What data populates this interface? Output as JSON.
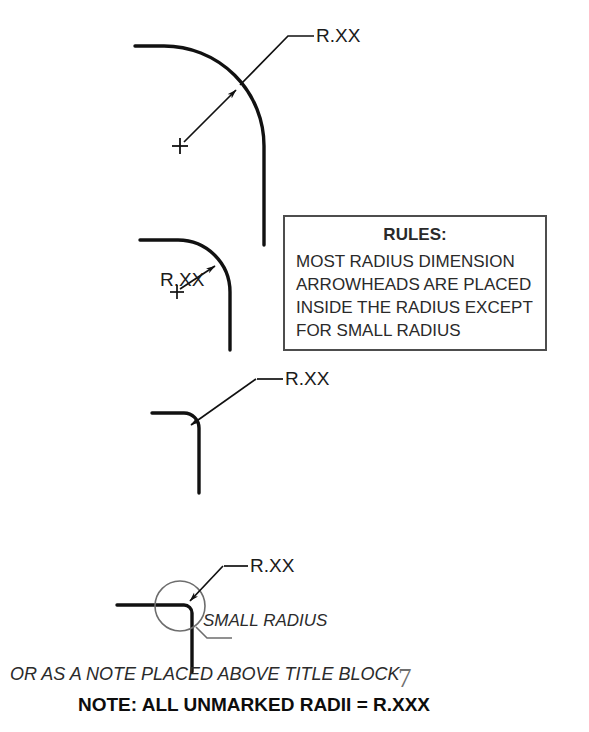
{
  "page": {
    "width": 589,
    "height": 732,
    "background": "#ffffff",
    "line_color": "#111111",
    "text_color": "#1b1b1b",
    "box_border_color": "#4d4d4d"
  },
  "figures": [
    {
      "id": "large-radius",
      "label": "R.XX",
      "arrowhead_placement": "inside",
      "center_mark": "+",
      "description": "Large radius fillet with dimension arrowhead placed inside the radius"
    },
    {
      "id": "medium-radius",
      "label": "R.XX",
      "arrowhead_placement": "inside",
      "center_mark": "+",
      "description": "Medium radius fillet with text and arrowhead inside the radius"
    },
    {
      "id": "small-radius-outside-leader",
      "label": "R.XX",
      "arrowhead_placement": "outside",
      "description": "Smaller radius with leader and arrowhead coming from outside"
    },
    {
      "id": "small-radius-detail",
      "label": "R.XX",
      "detail_label": "SMALL RADIUS",
      "arrowhead_placement": "outside",
      "description": "Very small radius shown with detail circle and outside leader"
    }
  ],
  "rules_box": {
    "title": "RULES:",
    "lines": [
      "MOST RADIUS DIMENSION",
      "ARROWHEADS ARE PLACED",
      "INSIDE THE RADIUS EXCEPT",
      "FOR SMALL RADIUS"
    ]
  },
  "annotations": {
    "small_radius_caption": "SMALL RADIUS",
    "note_alternative": "OR AS A NOTE PLACED ABOVE TITLE BLOCK",
    "note_main": "NOTE: ALL UNMARKED RADII = R.XXX",
    "page_mark": "7"
  }
}
